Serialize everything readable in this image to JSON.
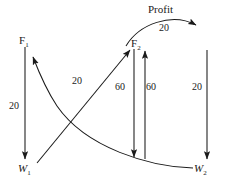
{
  "diagram": {
    "title_annotation": "Profit",
    "nodes": [
      {
        "id": "F1",
        "base": "F",
        "sub": "1",
        "style": "upright",
        "x": 19,
        "y": 35
      },
      {
        "id": "F2",
        "base": "F",
        "sub": "2",
        "style": "upright",
        "x": 131,
        "y": 38
      },
      {
        "id": "W1",
        "base": "W",
        "sub": "1",
        "style": "italic",
        "x": 18,
        "y": 163
      },
      {
        "id": "W2",
        "base": "W",
        "sub": "2",
        "style": "italic",
        "x": 194,
        "y": 163
      }
    ],
    "edges": [
      {
        "name": "f1-to-w1",
        "shape": "straight-vertical",
        "from": "F1",
        "to": "W1",
        "direction": "down",
        "value": "20",
        "label_x": 9,
        "label_y": 101
      },
      {
        "name": "w1-to-f2",
        "shape": "straight-diagonal",
        "from": "W1",
        "to": "F2",
        "direction": "up-right",
        "value": "20",
        "label_x": 72,
        "label_y": 76
      },
      {
        "name": "w2-to-f1",
        "shape": "curve",
        "from": "W2",
        "to": "F1",
        "direction": "left-up",
        "value": "",
        "label_x": 0,
        "label_y": 0
      },
      {
        "name": "f2-to-w2-left",
        "shape": "straight-vertical",
        "from": "F2",
        "to": "W2",
        "direction": "down",
        "value": "60",
        "label_x": 115,
        "label_y": 82
      },
      {
        "name": "w2-to-f2-right",
        "shape": "straight-vertical",
        "from": "W2",
        "to": "F2",
        "direction": "up",
        "value": "60",
        "label_x": 146,
        "label_y": 82
      },
      {
        "name": "f2-to-w2-far-right",
        "shape": "straight-vertical",
        "from": "F2",
        "to": "W2",
        "direction": "down",
        "value": "20",
        "label_x": 192,
        "label_y": 82
      },
      {
        "name": "profit-arc",
        "shape": "arc",
        "from": "F2",
        "to": "W2",
        "direction": "over-right",
        "value": "20",
        "label_x": 159,
        "label_y": 23
      }
    ],
    "profit_label_x": 148,
    "profit_label_y": 4,
    "stroke_color": "#1a1a1a"
  }
}
